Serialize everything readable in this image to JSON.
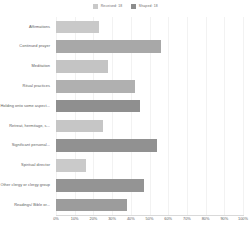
{
  "chart_data": {
    "type": "bar",
    "orientation": "horizontal",
    "title": "",
    "xlabel": "",
    "ylabel": "",
    "xlim": [
      0,
      100
    ],
    "xtick_labels": [
      "0%",
      "10%",
      "20%",
      "30%",
      "40%",
      "50%",
      "60%",
      "70%",
      "80%",
      "90%",
      "100%"
    ],
    "xtick_values": [
      0,
      10,
      20,
      30,
      40,
      50,
      60,
      70,
      80,
      90,
      100
    ],
    "grid": true,
    "legend_position": "top-center",
    "legend": [
      {
        "label": "Received: 18",
        "color": "#c9c9c9"
      },
      {
        "label": "Shaped: 18",
        "color": "#8c8c8c"
      }
    ],
    "categories": [
      "Affirmations",
      "Continued prayer",
      "Meditation",
      "Ritual practices",
      "Holding onto some aspect...",
      "Retreat, hermitage, s...",
      "Significant personal...",
      "Spiritual director",
      "Other clergy or clergy group",
      "Readings/ Bible or..."
    ],
    "values": [
      23,
      56,
      28,
      42,
      45,
      25,
      54,
      16,
      47,
      38
    ],
    "bar_colors": [
      "#c9c9c9",
      "#a8a8a8",
      "#c4c4c4",
      "#b0b0b0",
      "#8f8f8f",
      "#c6c6c6",
      "#919191",
      "#cacaca",
      "#949494",
      "#9c9c9c"
    ],
    "grid_color": "#f2f2f2",
    "axis_color": "#d9d9d9",
    "text_color": "#5c5c5c"
  }
}
